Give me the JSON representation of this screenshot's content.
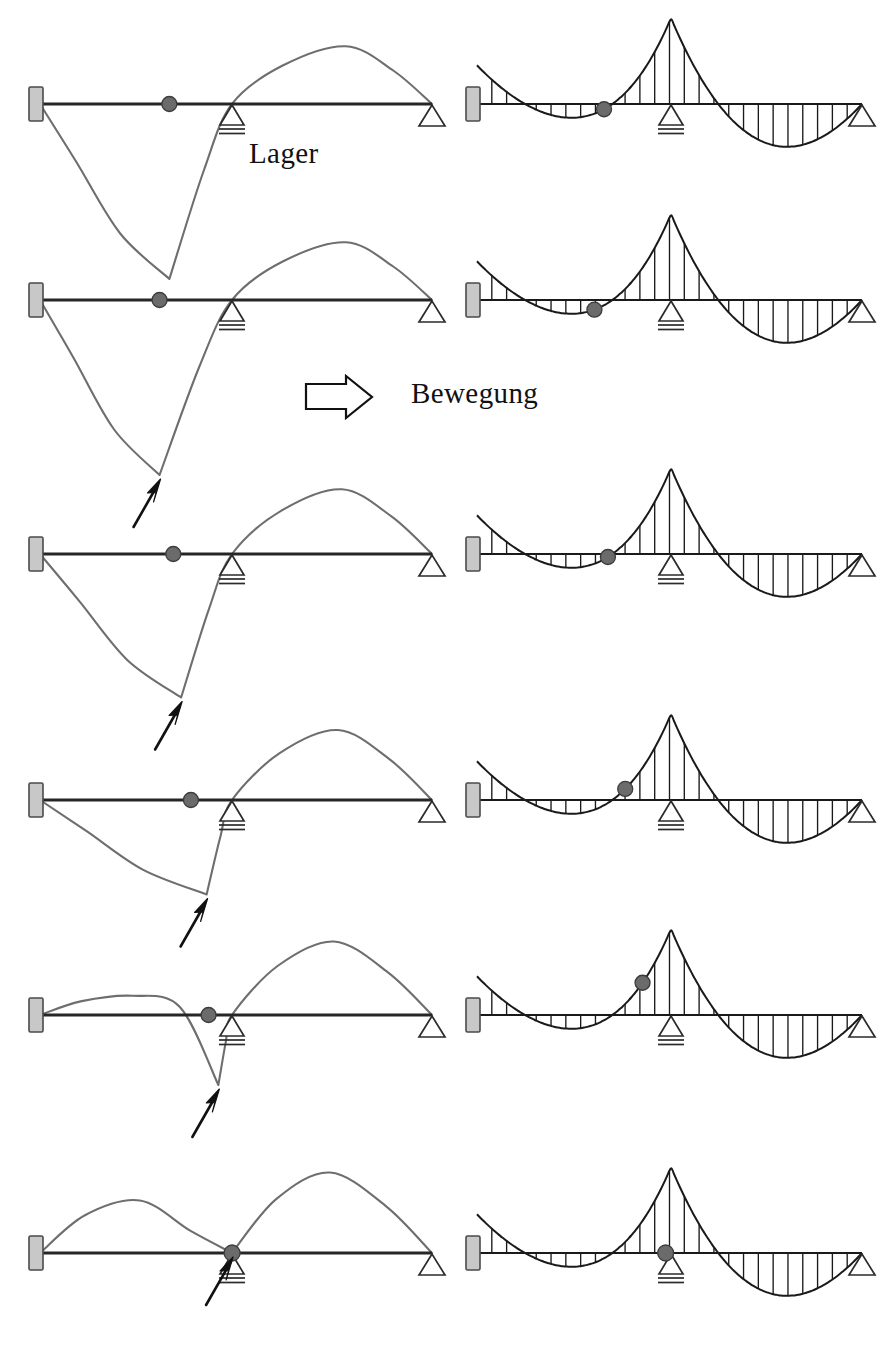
{
  "figure": {
    "title_labels": {
      "lager": "Lager",
      "bewegung": "Bewegung"
    },
    "icons": {
      "motion_arrow": "right-arrow-outline-icon",
      "pointer_arrow": "up-right-arrow-icon",
      "fixed_support": "fixed-wall-support-icon",
      "roller_support": "roller-support-icon",
      "pin_support": "pin-support-icon",
      "load_marker": "moving-load-marker-icon"
    },
    "colors": {
      "beam": "#262626",
      "influence_curve": "#6e6e6e",
      "moment_outline": "#1a1a1a",
      "hatch": "#1a1a1a",
      "support_fill": "#c8c8c8",
      "support_stroke": "#4a4a4a",
      "marker_fill": "#6b6b6b",
      "marker_stroke": "#3c3c3c",
      "background": "#ffffff"
    },
    "geometry": {
      "beam_left_x": 40,
      "beam_right_x": 432,
      "middle_support_x": 232,
      "right_beam_left_x": 477,
      "right_beam_right_x": 862,
      "right_middle_support_x": 671
    }
  },
  "chart_data": {
    "type": "line",
    "title": "",
    "xlabel": "",
    "ylabel": "",
    "rows": [
      {
        "index": 1,
        "beam_y": 104,
        "marker_x_ratio": 0.33,
        "marker_label": "load-position-1",
        "influence": {
          "min_value": -1.0,
          "min_x_ratio": 0.33,
          "max_value": 0.33,
          "max_x_ratio": 0.78,
          "left_peak_value": 0.0
        },
        "moment": {
          "support_moment": 1.0,
          "left_span_min": -0.33,
          "right_span_min": -0.54,
          "wall_moment": 0.45
        },
        "pointer_arrow": false
      },
      {
        "index": 2,
        "beam_y": 300,
        "marker_x_ratio": 0.305,
        "marker_label": "load-position-2",
        "influence": {
          "min_value": -1.0,
          "min_x_ratio": 0.305,
          "max_value": 0.33,
          "max_x_ratio": 0.78,
          "left_peak_value": 0.0
        },
        "moment": {
          "support_moment": 1.0,
          "left_span_min": -0.33,
          "right_span_min": -0.54,
          "wall_moment": 0.45
        },
        "pointer_arrow": true
      },
      {
        "index": 3,
        "beam_y": 554,
        "marker_x_ratio": 0.34,
        "marker_label": "load-position-3",
        "influence": {
          "min_value": -0.82,
          "min_x_ratio": 0.36,
          "max_value": 0.37,
          "max_x_ratio": 0.77,
          "left_peak_value": 0.0
        },
        "moment": {
          "support_moment": 1.0,
          "left_span_min": -0.33,
          "right_span_min": -0.54,
          "wall_moment": 0.45
        },
        "pointer_arrow": true
      },
      {
        "index": 4,
        "beam_y": 800,
        "marker_x_ratio": 0.385,
        "marker_label": "load-position-4",
        "influence": {
          "min_value": -0.54,
          "min_x_ratio": 0.425,
          "max_value": 0.4,
          "max_x_ratio": 0.76,
          "left_peak_value": 0.0
        },
        "moment": {
          "support_moment": 1.0,
          "left_span_min": -0.33,
          "right_span_min": -0.54,
          "wall_moment": 0.45
        },
        "pointer_arrow": true
      },
      {
        "index": 5,
        "beam_y": 1015,
        "marker_x_ratio": 0.43,
        "marker_label": "load-position-5",
        "influence": {
          "min_value": -0.4,
          "min_x_ratio": 0.455,
          "max_value": 0.42,
          "max_x_ratio": 0.75,
          "left_peak_value": 0.11
        },
        "moment": {
          "support_moment": 1.0,
          "left_span_min": -0.33,
          "right_span_min": -0.54,
          "wall_moment": 0.45
        },
        "pointer_arrow": true
      },
      {
        "index": 6,
        "beam_y": 1253,
        "marker_x_ratio": 0.49,
        "marker_label": "load-position-6",
        "influence": {
          "min_value": 0.0,
          "min_x_ratio": 0.49,
          "max_value": 0.46,
          "max_x_ratio": 0.74,
          "left_peak_value": 0.3
        },
        "moment": {
          "support_moment": 1.0,
          "left_span_min": -0.33,
          "right_span_min": -0.54,
          "wall_moment": 0.45
        },
        "pointer_arrow": true
      }
    ]
  }
}
